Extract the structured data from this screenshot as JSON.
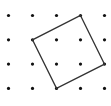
{
  "diagram": {
    "type": "dot-grid-with-polygon",
    "grid": {
      "columns": 5,
      "rows": 4
    },
    "dot_color": "#111111",
    "line_color": "#333333",
    "polygon": {
      "shape": "square",
      "vertices": [
        {
          "col": 3,
          "row": 0
        },
        {
          "col": 4,
          "row": 2
        },
        {
          "col": 2,
          "row": 3
        },
        {
          "col": 1,
          "row": 1
        }
      ]
    }
  }
}
